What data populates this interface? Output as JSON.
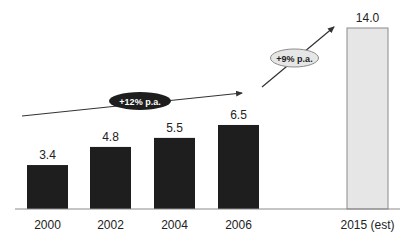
{
  "chart_data": {
    "type": "bar",
    "title": "",
    "xlabel": "",
    "ylabel": "",
    "categories": [
      "2000",
      "2002",
      "2004",
      "2006",
      "2015 (est)"
    ],
    "values": [
      3.4,
      4.8,
      5.5,
      6.5,
      14.0
    ],
    "value_labels": [
      "3.4",
      "4.8",
      "5.5",
      "6.5",
      "14.0"
    ],
    "bar_colors": [
      "#1e1e1e",
      "#1e1e1e",
      "#1e1e1e",
      "#1e1e1e",
      "#e6e6e6"
    ],
    "ylim": [
      0,
      15
    ],
    "grid": false,
    "legend": null,
    "annotations": [
      {
        "text": "+12% p.a.",
        "style": "dark",
        "from": "2000",
        "to": "2006"
      },
      {
        "text": "+9% p.a.",
        "style": "light",
        "from": "2006",
        "to": "2015 (est)"
      }
    ]
  },
  "colors": {
    "actual_bar": "#1e1e1e",
    "estimate_bar": "#e6e6e6",
    "estimate_border": "#8a8a8a",
    "axis": "#8a8a8a",
    "arrow": "#333333"
  }
}
